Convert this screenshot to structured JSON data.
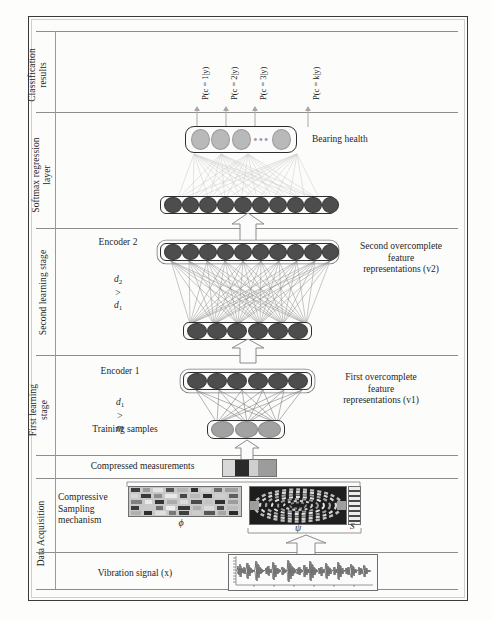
{
  "figure": {
    "stages": [
      {
        "id": "classification",
        "label": "Classification\nresults"
      },
      {
        "id": "softmax",
        "label": "Softmax regression\nlayer"
      },
      {
        "id": "second_learning",
        "label": "Second learning stage"
      },
      {
        "id": "first_learning",
        "label": "First learning\nstage"
      },
      {
        "id": "data_acquisition",
        "label": "Data Acquisition"
      }
    ],
    "classification_outputs": [
      "P(c = 1|y)",
      "P(c = 2|y)",
      "P(c = 3|y)",
      "P(c = k|y)"
    ],
    "right_labels": {
      "bearing_health": "Bearing health",
      "second_overcomplete": "Second overcomplete\nfeature\nrepresentations (v2)",
      "first_overcomplete": "First overcomplete\nfeature\nrepresentations (v1)"
    },
    "center_labels": {
      "encoder2": "Encoder 2",
      "encoder2_condition": "d2 > d1",
      "encoder1": "Encoder 1",
      "encoder1_condition": "d1 > m",
      "training_samples": "Training samples",
      "compressed_measurements": "Compressed measurements",
      "compressive_sampling": "Compressive\nSampling\nmechanism",
      "vibration_signal": "Vibration signal (x)"
    },
    "math_symbols": {
      "phi": "ϕ",
      "psi": "ψ",
      "sparse": "S",
      "d2": "d",
      "d2_sub": "2",
      "d1": "d",
      "d1_sub": "1",
      "m": "m",
      "gt": ">"
    },
    "layers": [
      {
        "id": "softmax-output-layer",
        "nodes": 4,
        "style": "light",
        "has_dots": true
      },
      {
        "id": "softmax-input-layer",
        "nodes": 10,
        "style": "dark",
        "has_dots": false
      },
      {
        "id": "encoder2-layer",
        "nodes": 10,
        "style": "dark",
        "has_dots": false
      },
      {
        "id": "v1-layer",
        "nodes": 6,
        "style": "dark",
        "has_dots": false
      },
      {
        "id": "encoder1-layer",
        "nodes": 6,
        "style": "dark",
        "has_dots": false
      },
      {
        "id": "training-samples-layer",
        "nodes": 3,
        "style": "mid",
        "has_dots": false
      }
    ],
    "colors": {
      "node_dark": "#4d4d4d",
      "node_light": "#b9b9b9",
      "node_mid": "#a2a2a2",
      "border": "#2e2e2e",
      "divider": "#8d8d8d",
      "page_border": "#3a3a3a",
      "connection_light": "#c9c9c9",
      "connection_dark": "#8f8f8f"
    }
  }
}
